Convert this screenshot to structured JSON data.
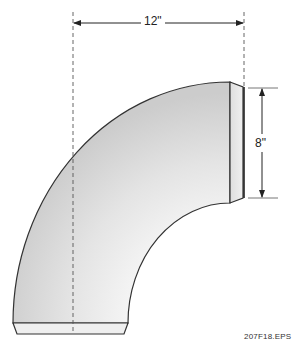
{
  "figure": {
    "dimensions": {
      "width": "12\"",
      "height": "8\""
    },
    "file_label": "207F18.EPS",
    "colors": {
      "outline": "#333333",
      "fill_light": "#f2f2f2",
      "fill_dark": "#cfcfcf",
      "dashed": "#555555"
    }
  }
}
